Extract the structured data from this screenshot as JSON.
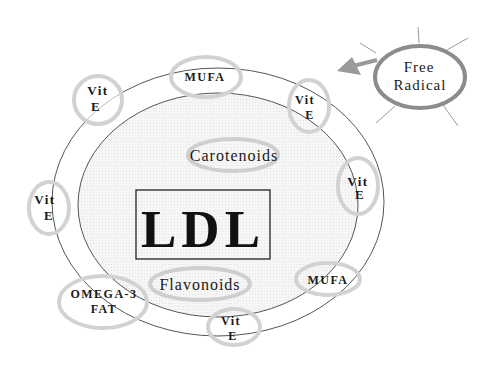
{
  "diagram": {
    "title": "LDL",
    "colors": {
      "background": "#ffffff",
      "inner_fill": "#f2f2f2",
      "ring_stroke": "#555555",
      "badge_stroke": "#cfcfcf",
      "radical_stroke": "#8c8c8c",
      "arrow_fill": "#9a9a9a",
      "text": "#1a1a1a"
    },
    "particle": {
      "label": "LDL",
      "inner_components": [
        {
          "id": "carotenoids",
          "label": "Carotenoids"
        },
        {
          "id": "flavonoids",
          "label": "Flavonoids"
        }
      ],
      "surface_components": [
        {
          "id": "vite-top-left",
          "line1": "Vit",
          "line2": "E"
        },
        {
          "id": "mufa-top",
          "line1": "MUFA"
        },
        {
          "id": "vite-top-right",
          "line1": "Vit",
          "line2": "E"
        },
        {
          "id": "vite-right",
          "line1": "Vit",
          "line2": "E"
        },
        {
          "id": "vite-left",
          "line1": "Vit",
          "line2": "E"
        },
        {
          "id": "mufa-bottom-right",
          "line1": "MUFA"
        },
        {
          "id": "omega3",
          "line1": "OMEGA-3",
          "line2": "FAT"
        },
        {
          "id": "vite-bottom",
          "line1": "Vit",
          "line2": "E"
        }
      ]
    },
    "free_radical": {
      "line1": "Free",
      "line2": "Radical",
      "arrow_direction": "toward LDL"
    }
  }
}
